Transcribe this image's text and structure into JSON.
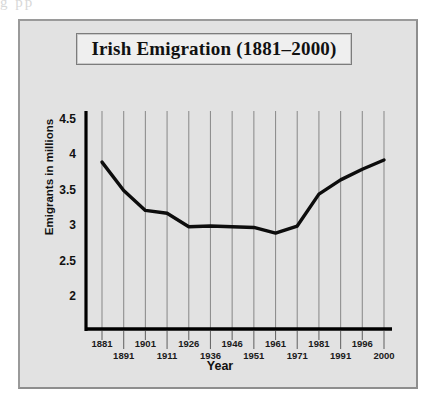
{
  "artifact": {
    "text": "g                       pp"
  },
  "chart_data": {
    "type": "line",
    "title": "Irish Emigration (1881–2000)",
    "xlabel": "Year",
    "ylabel": "Emigrants in millions",
    "categories": [
      "1881",
      "1891",
      "1901",
      "1911",
      "1926",
      "1936",
      "1946",
      "1951",
      "1961",
      "1971",
      "1981",
      "1991",
      "1996",
      "2000"
    ],
    "values": [
      3.9,
      3.5,
      3.22,
      3.18,
      2.99,
      3.0,
      2.99,
      2.98,
      2.9,
      3.0,
      3.45,
      3.65,
      3.8,
      3.93
    ],
    "series": [
      {
        "name": "Emigrants in millions",
        "values": [
          3.9,
          3.5,
          3.22,
          3.18,
          2.99,
          3.0,
          2.99,
          2.98,
          2.9,
          3.0,
          3.45,
          3.65,
          3.8,
          3.93
        ]
      }
    ],
    "ytick_labels": [
      "4.5",
      "4",
      "3.5",
      "3",
      "2.5",
      "2"
    ],
    "ytick_values": [
      4.5,
      4,
      3.5,
      3,
      2.5,
      2
    ],
    "ylim": [
      1.55,
      4.62
    ],
    "grid": "vertical",
    "legend": "none",
    "line_color": "#0d0d0d",
    "grid_color": "#8f8f8f",
    "axis_color": "#000000",
    "plot_background": "#e2e2e2"
  }
}
